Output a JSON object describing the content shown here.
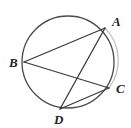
{
  "figure": {
    "type": "circle-geometry-diagram",
    "background_color": "#ffffff",
    "stroke_color": "#3a3a3a",
    "light_stroke_color": "#b9b9b9",
    "label_color": "#222222",
    "width": 131,
    "height": 128,
    "circle": {
      "name": "circumscribed-circle",
      "cx": 68,
      "cy": 62,
      "r": 46,
      "stroke_width": 1.2
    },
    "points": [
      {
        "id": "A",
        "label": "A",
        "x": 105,
        "y": 28,
        "label_x": 112,
        "label_y": 15
      },
      {
        "id": "B",
        "label": "B",
        "x": 24,
        "y": 62,
        "label_x": 9,
        "label_y": 56
      },
      {
        "id": "C",
        "label": "C",
        "x": 109,
        "y": 88,
        "label_x": 116,
        "label_y": 82
      },
      {
        "id": "D",
        "label": "D",
        "x": 60,
        "y": 109,
        "label_x": 54,
        "label_y": 113
      }
    ],
    "chords": [
      {
        "name": "chord-B-A",
        "from": "B",
        "to": "A"
      },
      {
        "name": "chord-B-C",
        "from": "B",
        "to": "C"
      },
      {
        "name": "chord-A-D",
        "from": "A",
        "to": "D"
      },
      {
        "name": "chord-C-D",
        "from": "C",
        "to": "D"
      }
    ]
  }
}
